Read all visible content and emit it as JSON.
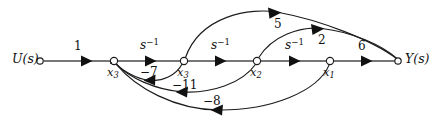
{
  "diagram": {
    "type": "signal-flow-graph",
    "title": "",
    "width": 442,
    "height": 123,
    "colors": {
      "stroke": "#1c1c1c",
      "trunk": "#4a4a4a",
      "background": "#ffffff",
      "text": "#111111"
    },
    "nodes": [
      {
        "id": "u",
        "label": "U(s)",
        "label_html": "U(s)",
        "x": 40,
        "y": 61,
        "r": 3.2,
        "label_x": 12,
        "label_y": 53,
        "kind": "input"
      },
      {
        "id": "x3d",
        "label": "x̅3",
        "label_html": "x<span class=\"sub\">3</span>",
        "x": 114,
        "y": 61,
        "r": 3.6,
        "label_x": 107,
        "label_y": 67,
        "kind": "state",
        "dot": true
      },
      {
        "id": "x3",
        "label": "x3",
        "label_html": "x<span class=\"sub\">3</span>",
        "x": 184,
        "y": 61,
        "r": 3.6,
        "label_x": 177,
        "label_y": 67,
        "kind": "state"
      },
      {
        "id": "x2",
        "label": "x2",
        "label_html": "x<span class=\"sub\">2</span>",
        "x": 257,
        "y": 61,
        "r": 3.6,
        "label_x": 250,
        "label_y": 67,
        "kind": "state"
      },
      {
        "id": "x1",
        "label": "x1",
        "label_html": "x<span class=\"sub\">1</span>",
        "x": 330,
        "y": 61,
        "r": 3.6,
        "label_x": 323,
        "label_y": 67,
        "kind": "state"
      },
      {
        "id": "y",
        "label": "Y(s)",
        "label_html": "Y(s)",
        "x": 398,
        "y": 61,
        "r": 3.2,
        "label_x": 405,
        "label_y": 53,
        "kind": "output"
      }
    ],
    "edges": [
      {
        "id": "e-u-x3d",
        "from": "u",
        "to": "x3d",
        "gain": "1",
        "gain_html": "1",
        "gain_x": 74,
        "gain_y": 40,
        "shape": "straight",
        "direction": "forward"
      },
      {
        "id": "e-x3d-x3",
        "from": "x3d",
        "to": "x3",
        "gain": "s^-1",
        "gain_html": "s<span class=\"sup\">−1</span>",
        "gain_x": 140,
        "gain_y": 38,
        "shape": "straight",
        "direction": "forward",
        "italic": true
      },
      {
        "id": "e-x3-x2",
        "from": "x3",
        "to": "x2",
        "gain": "s^-1",
        "gain_html": "s<span class=\"sup\">−1</span>",
        "gain_x": 211,
        "gain_y": 38,
        "shape": "straight",
        "direction": "forward",
        "italic": true
      },
      {
        "id": "e-x2-x1",
        "from": "x2",
        "to": "x1",
        "gain": "s^-1",
        "gain_html": "s<span class=\"sup\">−1</span>",
        "gain_x": 285,
        "gain_y": 38,
        "shape": "straight",
        "direction": "forward",
        "italic": true
      },
      {
        "id": "e-x1-y",
        "from": "x1",
        "to": "y",
        "gain": "6",
        "gain_html": "6",
        "gain_x": 358,
        "gain_y": 40,
        "shape": "straight",
        "direction": "forward"
      },
      {
        "id": "e-x3-y",
        "from": "x3",
        "to": "y",
        "gain": "5",
        "gain_html": "5",
        "gain_x": 274,
        "gain_y": 18,
        "shape": "arc-above",
        "direction": "forward"
      },
      {
        "id": "e-x2-y",
        "from": "x2",
        "to": "y",
        "gain": "2",
        "gain_html": "2",
        "gain_x": 318,
        "gain_y": 34,
        "shape": "arc-above",
        "direction": "forward"
      },
      {
        "id": "e-x3-x3d",
        "from": "x3",
        "to": "x3d",
        "gain": "-7",
        "gain_html": "−7",
        "gain_x": 140,
        "gain_y": 66,
        "shape": "arc-below",
        "direction": "feedback"
      },
      {
        "id": "e-x2-x3d",
        "from": "x2",
        "to": "x3d",
        "gain": "-11",
        "gain_html": "−11",
        "gain_x": 172,
        "gain_y": 79,
        "shape": "arc-below",
        "direction": "feedback"
      },
      {
        "id": "e-x1-x3d",
        "from": "x1",
        "to": "x3d",
        "gain": "-8",
        "gain_html": "−8",
        "gain_x": 203,
        "gain_y": 95,
        "shape": "arc-below",
        "direction": "feedback"
      }
    ]
  }
}
